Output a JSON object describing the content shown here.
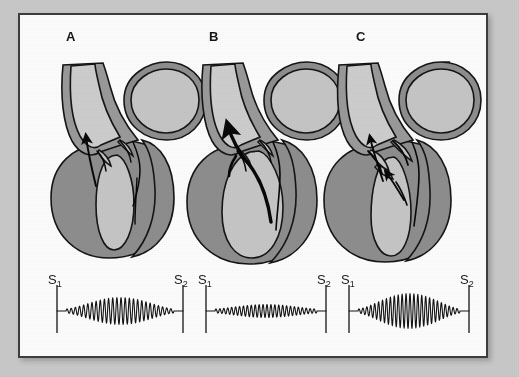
{
  "figure": {
    "frame": {
      "mat_color": "#c9c9c9",
      "border_color": "#3d3d3d",
      "page_color": "#fdfdfd"
    },
    "colors": {
      "myocardium": "#8e8e8e",
      "chamber": "#c6c6c6",
      "vessel_wall": "#9a9a9a",
      "vessel_lumen": "#cecece",
      "outline": "#151515",
      "flow_arrow": "#080808"
    }
  },
  "panels": [
    {
      "letter": "A",
      "diagram_name": "heart-cross-section-a",
      "flow_arrow_weight": "thin",
      "tracing": {
        "name": "phonocardiogram-a",
        "start_label": "S",
        "start_sub": "1",
        "end_label": "S",
        "end_sub": "2",
        "murmur_shape": "crescendo-decrescendo",
        "murmur_amplitude": "moderate",
        "cycles": 26
      }
    },
    {
      "letter": "B",
      "diagram_name": "heart-cross-section-b",
      "flow_arrow_weight": "thick",
      "tracing": {
        "name": "phonocardiogram-b",
        "start_label": "S",
        "start_sub": "1",
        "end_label": "S",
        "end_sub": "2",
        "murmur_shape": "crescendo-decrescendo",
        "murmur_amplitude": "low",
        "cycles": 26
      }
    },
    {
      "letter": "C",
      "diagram_name": "heart-cross-section-c",
      "flow_arrow_weight": "thin-double",
      "tracing": {
        "name": "phonocardiogram-c",
        "start_label": "S",
        "start_sub": "1",
        "end_label": "S",
        "end_sub": "2",
        "murmur_shape": "crescendo-decrescendo",
        "murmur_amplitude": "high",
        "cycles": 26
      }
    }
  ]
}
